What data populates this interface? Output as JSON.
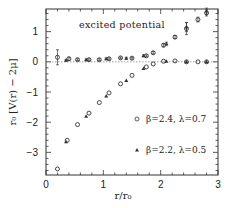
{
  "chart_data": {
    "type": "scatter",
    "title": "",
    "annotation": "excited potential",
    "xlabel": "r/r₀",
    "ylabel": "r₀ [V(r) − 2μ]",
    "xlim": [
      0,
      3
    ],
    "ylim": [
      -3.75,
      1.75
    ],
    "x_ticks": [
      0,
      1,
      2,
      3
    ],
    "x_tick_labels": [
      "0",
      "1",
      "2",
      "3"
    ],
    "y_ticks": [
      -3,
      -2,
      -1,
      0,
      1
    ],
    "y_tick_labels": [
      "−3",
      "−2",
      "−1",
      "0",
      "1"
    ],
    "grid": false,
    "reference_line": {
      "y": 0,
      "style": "dotted"
    },
    "legend": {
      "position": "lower right",
      "entries": [
        {
          "marker": "circle",
          "label": "β=2.4, λ=0.7"
        },
        {
          "marker": "triangle",
          "label": "β=2.2, λ=0.5"
        }
      ]
    },
    "series": [
      {
        "name": "β=2.4, λ=0.7 (ground)",
        "marker": "circle",
        "points": [
          [
            0.2,
            -3.55
          ],
          [
            0.37,
            -2.6
          ],
          [
            0.55,
            -2.08
          ],
          [
            0.75,
            -1.7
          ],
          [
            0.93,
            -1.35
          ],
          [
            1.1,
            -1.03
          ],
          [
            1.3,
            -0.73
          ],
          [
            1.5,
            -0.45
          ],
          [
            1.75,
            -0.17
          ],
          [
            1.87,
            -0.07
          ],
          [
            2.05,
            0.02
          ],
          [
            2.25,
            0.03
          ],
          [
            2.45,
            0.0
          ],
          [
            2.65,
            0.0
          ],
          [
            2.8,
            0.0
          ]
        ]
      },
      {
        "name": "β=2.2, λ=0.5 (ground)",
        "marker": "triangle",
        "points": [
          [
            0.35,
            -2.65
          ],
          [
            0.7,
            -1.8
          ],
          [
            1.05,
            -1.13
          ],
          [
            1.4,
            -0.62
          ],
          [
            1.7,
            -0.22
          ],
          [
            2.1,
            0.02
          ],
          [
            2.45,
            0.0
          ],
          [
            2.8,
            0.0
          ]
        ]
      },
      {
        "name": "β=2.4, λ=0.7 (excited)",
        "marker": "circle",
        "points": [
          [
            0.2,
            0.15,
            0.25
          ],
          [
            0.4,
            0.1,
            0.05
          ],
          [
            0.55,
            0.07,
            0.03
          ],
          [
            0.75,
            0.07,
            0.03
          ],
          [
            0.93,
            0.07,
            0.03
          ],
          [
            1.1,
            0.1,
            0.03
          ],
          [
            1.3,
            0.13,
            0.03
          ],
          [
            1.5,
            0.12,
            0.03
          ],
          [
            1.75,
            0.2,
            0.03
          ],
          [
            1.87,
            0.3,
            0.04
          ],
          [
            2.05,
            0.55,
            0.05
          ],
          [
            2.25,
            0.82,
            0.05
          ],
          [
            2.45,
            1.1,
            0.2
          ],
          [
            2.65,
            1.4,
            0.08
          ],
          [
            2.8,
            1.62,
            0.1
          ]
        ]
      },
      {
        "name": "β=2.2, λ=0.5 (excited)",
        "marker": "triangle",
        "points": [
          [
            0.35,
            0.05,
            0.03
          ],
          [
            0.7,
            0.07,
            0.03
          ],
          [
            1.05,
            0.1,
            0.03
          ],
          [
            1.4,
            0.12,
            0.03
          ],
          [
            1.7,
            0.2,
            0.03
          ],
          [
            2.1,
            0.6,
            0.05
          ],
          [
            2.45,
            1.15,
            0.15
          ],
          [
            2.8,
            1.68,
            0.1
          ]
        ]
      }
    ]
  }
}
